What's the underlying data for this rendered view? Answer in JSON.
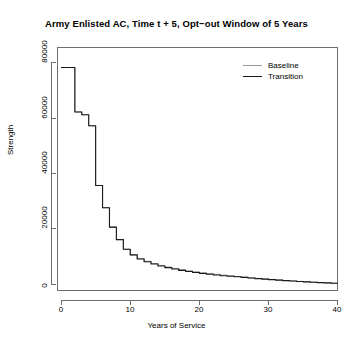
{
  "chart": {
    "title": "Army Enlisted AC, Time t + 5, Opt−out Window of 5 Years",
    "xaxis_title": "Years of Service",
    "yaxis_title": "Strength"
  },
  "legend": {
    "items": [
      {
        "label": "Baseline",
        "color": "#9a9a9a"
      },
      {
        "label": "Transition",
        "color": "#1a1a1a"
      }
    ]
  },
  "ticks": {
    "x": [
      "0",
      "10",
      "20",
      "30",
      "40"
    ],
    "y": [
      "0",
      "20000",
      "40000",
      "60000",
      "80000"
    ]
  },
  "chart_data": {
    "type": "line",
    "title": "Army Enlisted AC, Time t + 5, Opt−out Window of 5 Years",
    "xlabel": "Years of Service",
    "ylabel": "Strength",
    "xlim": [
      0,
      40
    ],
    "ylim": [
      0,
      80000
    ],
    "xticks": [
      0,
      10,
      20,
      30,
      40
    ],
    "yticks": [
      0,
      20000,
      40000,
      60000,
      80000
    ],
    "grid": false,
    "legend_position": "top-right",
    "step_style": "step-post",
    "x": [
      0,
      1,
      2,
      3,
      4,
      5,
      6,
      7,
      8,
      9,
      10,
      11,
      12,
      13,
      14,
      15,
      16,
      17,
      18,
      19,
      20,
      21,
      22,
      23,
      24,
      25,
      26,
      27,
      28,
      29,
      30,
      31,
      32,
      33,
      34,
      35,
      36,
      37,
      38,
      39,
      40
    ],
    "series": [
      {
        "name": "Baseline",
        "color": "#9a9a9a",
        "values": [
          78000,
          78000,
          62000,
          61000,
          57000,
          35500,
          27500,
          20500,
          16000,
          12500,
          10500,
          9200,
          8200,
          7400,
          6700,
          6100,
          5600,
          5150,
          4750,
          4400,
          4100,
          3800,
          3500,
          3200,
          2950,
          2700,
          2450,
          2200,
          2000,
          1800,
          1600,
          1420,
          1250,
          1080,
          930,
          790,
          650,
          520,
          400,
          260,
          120
        ]
      },
      {
        "name": "Transition",
        "color": "#1a1a1a",
        "values": [
          78000,
          78000,
          62000,
          61000,
          57000,
          35500,
          27500,
          20500,
          16000,
          12500,
          10500,
          9000,
          8000,
          7200,
          6500,
          5900,
          5400,
          4900,
          4500,
          4150,
          3800,
          3500,
          3250,
          3000,
          2800,
          2600,
          2400,
          2150,
          1950,
          1750,
          1560,
          1390,
          1220,
          1060,
          910,
          770,
          640,
          510,
          390,
          255,
          115
        ]
      }
    ]
  }
}
